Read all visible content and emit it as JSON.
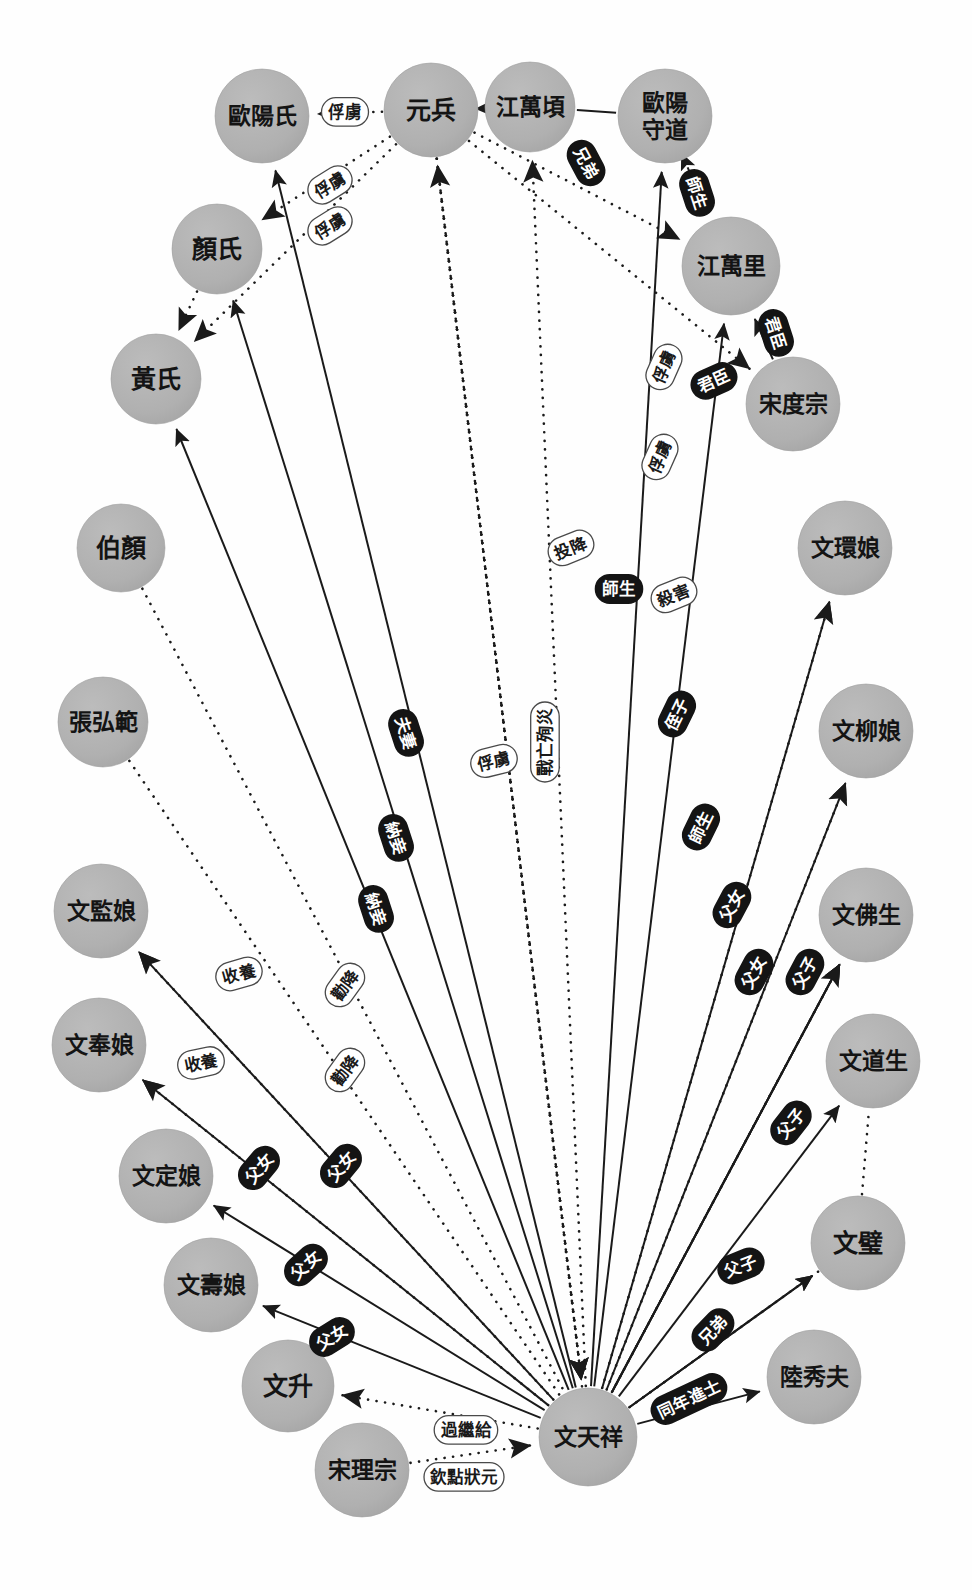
{
  "diagram": {
    "type": "social-network-graph",
    "canvas": {
      "width": 972,
      "height": 1590,
      "background": "#ffffff"
    },
    "style": {
      "node_fill": "#b1b1b1",
      "node_text": "#141414",
      "solid_edge_color": "#1a1a1a",
      "dotted_edge_color": "#1a1a1a",
      "dark_label_bg": "#141414",
      "dark_label_text": "#ffffff",
      "light_label_bg": "#ffffff",
      "light_label_text": "#1a1a1a",
      "light_label_border": "#4a4a4a"
    },
    "legend": {
      "solid_meaning": "實線：親屬／社會關係",
      "dotted_meaning": "虛線：敵對／事件關係"
    }
  },
  "nodes": [
    {
      "id": "ouyangshi",
      "label": "歐陽氏",
      "x": 262,
      "y": 116,
      "r": 47,
      "lines": [
        "歐陽氏"
      ]
    },
    {
      "id": "yuanbing",
      "label": "元兵",
      "x": 431,
      "y": 110,
      "r": 47,
      "lines": [
        "元兵"
      ]
    },
    {
      "id": "jiangwanqing",
      "label": "江萬頃",
      "x": 530,
      "y": 107,
      "r": 45,
      "lines": [
        "江萬頃"
      ]
    },
    {
      "id": "ouyangshoudao",
      "label": "歐陽守道",
      "x": 665,
      "y": 116,
      "r": 47,
      "lines": [
        "歐陽",
        "守道"
      ]
    },
    {
      "id": "yanshi",
      "label": "顏氏",
      "x": 217,
      "y": 249,
      "r": 45,
      "lines": [
        "顏氏"
      ]
    },
    {
      "id": "jiangwanli",
      "label": "江萬里",
      "x": 731,
      "y": 266,
      "r": 49,
      "lines": [
        "江萬里"
      ]
    },
    {
      "id": "huangshi",
      "label": "黃氏",
      "x": 156,
      "y": 379,
      "r": 45,
      "lines": [
        "黃氏"
      ]
    },
    {
      "id": "songduzong",
      "label": "宋度宗",
      "x": 793,
      "y": 404,
      "r": 47,
      "lines": [
        "宋度宗"
      ]
    },
    {
      "id": "wenhuanniang",
      "label": "文環娘",
      "x": 845,
      "y": 548,
      "r": 47,
      "lines": [
        "文環娘"
      ]
    },
    {
      "id": "boyan",
      "label": "伯顏",
      "x": 121,
      "y": 548,
      "r": 44,
      "lines": [
        "伯顏"
      ]
    },
    {
      "id": "wenliuniang",
      "label": "文柳娘",
      "x": 866,
      "y": 731,
      "r": 47,
      "lines": [
        "文柳娘"
      ]
    },
    {
      "id": "zhanghongfan",
      "label": "張弘範",
      "x": 103,
      "y": 722,
      "r": 45,
      "lines": [
        "張弘範"
      ]
    },
    {
      "id": "wenfosheng",
      "label": "文佛生",
      "x": 866,
      "y": 915,
      "r": 47,
      "lines": [
        "文佛生"
      ]
    },
    {
      "id": "wenjianniang",
      "label": "文監娘",
      "x": 101,
      "y": 911,
      "r": 47,
      "lines": [
        "文監娘"
      ]
    },
    {
      "id": "wendaosheng",
      "label": "文道生",
      "x": 873,
      "y": 1061,
      "r": 47,
      "lines": [
        "文道生"
      ]
    },
    {
      "id": "wenfengniang",
      "label": "文奉娘",
      "x": 99,
      "y": 1045,
      "r": 47,
      "lines": [
        "文奉娘"
      ]
    },
    {
      "id": "wendingniang",
      "label": "文定娘",
      "x": 166,
      "y": 1176,
      "r": 47,
      "lines": [
        "文定娘"
      ]
    },
    {
      "id": "wenbi",
      "label": "文璧",
      "x": 858,
      "y": 1243,
      "r": 47,
      "lines": [
        "文璧"
      ]
    },
    {
      "id": "wenshouniang",
      "label": "文壽娘",
      "x": 211,
      "y": 1285,
      "r": 47,
      "lines": [
        "文壽娘"
      ]
    },
    {
      "id": "luxiufu",
      "label": "陸秀夫",
      "x": 814,
      "y": 1377,
      "r": 47,
      "lines": [
        "陸秀夫"
      ]
    },
    {
      "id": "wensheng",
      "label": "文升",
      "x": 288,
      "y": 1386,
      "r": 46,
      "lines": [
        "文升"
      ]
    },
    {
      "id": "wentianxiang",
      "label": "文天祥",
      "x": 588,
      "y": 1437,
      "r": 49,
      "lines": [
        "文天祥"
      ]
    },
    {
      "id": "songlizong",
      "label": "宋理宗",
      "x": 362,
      "y": 1470,
      "r": 47,
      "lines": [
        "宋理宗"
      ]
    }
  ],
  "edges": [
    {
      "id": "e1",
      "from": "yuanbing",
      "to": "ouyangshi",
      "label": "俘虜",
      "style": "dotted",
      "label_style": "light",
      "label_x": 345,
      "label_y": 112,
      "rot": 0,
      "arrow": "to"
    },
    {
      "id": "e2",
      "from": "yuanbing",
      "to": "yanshi",
      "label": "俘虜",
      "style": "dotted",
      "label_style": "light",
      "label_x": 330,
      "label_y": 185,
      "rot": -32,
      "arrow": "to"
    },
    {
      "id": "e3",
      "from": "yuanbing",
      "to": "huangshi",
      "label": "俘虜",
      "style": "dotted",
      "label_style": "light",
      "label_x": 330,
      "label_y": 226,
      "rot": -32,
      "arrow": "to"
    },
    {
      "id": "e4",
      "from": "jiangwanqing",
      "to": "ouyangshoudao",
      "label": "兄弟",
      "style": "solid",
      "label_style": "dark",
      "label_x": 586,
      "label_y": 163,
      "rot": 62,
      "arrow": "none"
    },
    {
      "id": "e5",
      "from": "ouyangshoudao",
      "to": "jiangwanli",
      "label": "師生",
      "style": "solid",
      "label_style": "dark",
      "label_x": 697,
      "label_y": 193,
      "rot": 72,
      "arrow": "both"
    },
    {
      "id": "e6",
      "from": "songduzong",
      "to": "jiangwanli",
      "label": "君臣",
      "style": "solid",
      "label_style": "dark",
      "label_x": 776,
      "label_y": 333,
      "rot": 72,
      "arrow": "to"
    },
    {
      "id": "e7",
      "from": "wentianxiang",
      "to": "jiangwanli",
      "label": "君臣",
      "style": "solid",
      "label_style": "dark",
      "label_x": 714,
      "label_y": 381,
      "rot": -24,
      "arrow": "to"
    },
    {
      "id": "e8",
      "from": "yuanbing",
      "to": "jiangwanli",
      "label": "俘虜",
      "style": "dotted",
      "label_style": "light",
      "label_x": 664,
      "label_y": 367,
      "rot": -66,
      "arrow": "to"
    },
    {
      "id": "e9",
      "from": "yuanbing",
      "to": "songduzong",
      "label": "俘虜",
      "style": "dotted",
      "label_style": "light",
      "label_x": 660,
      "label_y": 457,
      "rot": -66,
      "arrow": "to"
    },
    {
      "id": "e10",
      "from": "yuanbing",
      "to": "wentianxiang",
      "label": "投降",
      "style": "dotted",
      "label_style": "light",
      "label_x": 571,
      "label_y": 548,
      "rot": -22,
      "arrow": "to"
    },
    {
      "id": "e11",
      "from": "wentianxiang",
      "to": "ouyangshoudao",
      "label": "師生",
      "style": "solid",
      "label_style": "dark",
      "label_x": 619,
      "label_y": 589,
      "rot": 0,
      "arrow": "to"
    },
    {
      "id": "e12",
      "from": "yuanbing",
      "to": "jiangwanqing",
      "label": "殺害",
      "style": "dotted",
      "label_style": "light",
      "label_x": 674,
      "label_y": 595,
      "rot": -22,
      "arrow": "to"
    },
    {
      "id": "e13",
      "from": "wentianxiang",
      "to": "yanshi",
      "label": "夫妻",
      "style": "solid",
      "label_style": "dark",
      "label_x": 406,
      "label_y": 733,
      "rot": 72,
      "arrow": "to"
    },
    {
      "id": "e14",
      "from": "wentianxiang",
      "to": "wenhuanniang",
      "label": "父女",
      "style": "solid",
      "label_style": "dark",
      "label_x": 732,
      "label_y": 905,
      "rot": -62,
      "arrow": "to"
    },
    {
      "id": "e15",
      "from": "wentianxiang",
      "to": "wenliuniang",
      "label": "侄子",
      "style": "dark-rot",
      "label_style": "dark",
      "label_x": 677,
      "label_y": 714,
      "rot": -64,
      "arrow": "to",
      "line": "solid"
    },
    {
      "id": "e16",
      "from": "wentianxiang",
      "to": "wenfosheng",
      "label": "師生",
      "style": "solid",
      "label_style": "dark",
      "label_x": 701,
      "label_y": 827,
      "rot": -64,
      "arrow": "to"
    },
    {
      "id": "e17",
      "from": "yuanbing",
      "to": "wentianxiang",
      "label": "俘虜",
      "style": "dotted",
      "label_style": "light",
      "label_x": 494,
      "label_y": 761,
      "rot": -14,
      "arrow": "to"
    },
    {
      "id": "e18",
      "from": "yuanbing",
      "to": "wentianxiang",
      "label": "戰亡殉災",
      "style": "dotted",
      "label_style": "light",
      "label_x": 545,
      "label_y": 742,
      "rot": -90,
      "arrow": "to"
    },
    {
      "id": "e19",
      "from": "wentianxiang",
      "to": "wenfosheng",
      "label": "父女",
      "style": "solid",
      "label_style": "dark",
      "label_x": 754,
      "label_y": 972,
      "rot": -62,
      "arrow": "to"
    },
    {
      "id": "e20",
      "from": "wentianxiang",
      "to": "wenfosheng",
      "label": "父子",
      "style": "solid",
      "label_style": "dark",
      "label_x": 805,
      "label_y": 972,
      "rot": -62,
      "arrow": "to"
    },
    {
      "id": "e21",
      "from": "wentianxiang",
      "to": "wendaosheng",
      "label": "父子",
      "style": "solid",
      "label_style": "dark",
      "label_x": 791,
      "label_y": 1123,
      "rot": -52,
      "arrow": "to"
    },
    {
      "id": "e22",
      "from": "wentianxiang",
      "to": "wenbi",
      "label": "父子",
      "style": "solid",
      "label_style": "dark",
      "label_x": 741,
      "label_y": 1266,
      "rot": -22,
      "arrow": "to"
    },
    {
      "id": "e23",
      "from": "wentianxiang",
      "to": "wenbi",
      "label": "兄弟",
      "style": "solid",
      "label_style": "dark",
      "label_x": 713,
      "label_y": 1330,
      "rot": -46,
      "arrow": "to"
    },
    {
      "id": "e24",
      "from": "wentianxiang",
      "to": "luxiufu",
      "label": "同年進士",
      "style": "solid",
      "label_style": "dark",
      "label_x": 689,
      "label_y": 1399,
      "rot": -25,
      "arrow": "to"
    },
    {
      "id": "e25",
      "from": "boyan",
      "to": "wentianxiang",
      "label": "勸降",
      "style": "dotted",
      "label_style": "light",
      "label_x": 345,
      "label_y": 985,
      "rot": -54,
      "arrow": "none"
    },
    {
      "id": "e26",
      "from": "zhanghongfan",
      "to": "wentianxiang",
      "label": "勸降",
      "style": "dotted",
      "label_style": "light",
      "label_x": 345,
      "label_y": 1070,
      "rot": -54,
      "arrow": "none"
    },
    {
      "id": "e27",
      "from": "wentianxiang",
      "to": "wenjianniang",
      "label": "收養",
      "style": "dotted",
      "label_style": "light",
      "label_x": 239,
      "label_y": 974,
      "rot": -16,
      "arrow": "to"
    },
    {
      "id": "e28",
      "from": "wentianxiang",
      "to": "wenfengniang",
      "label": "收養",
      "style": "dotted",
      "label_style": "light",
      "label_x": 201,
      "label_y": 1063,
      "rot": -12,
      "arrow": "to"
    },
    {
      "id": "e29",
      "from": "wentianxiang",
      "to": "wenjianniang",
      "label": "父女",
      "style": "solid",
      "label_style": "dark",
      "label_x": 341,
      "label_y": 1166,
      "rot": -50,
      "arrow": "to"
    },
    {
      "id": "e30",
      "from": "wentianxiang",
      "to": "wenfengniang",
      "label": "父女",
      "style": "solid",
      "label_style": "dark",
      "label_x": 259,
      "label_y": 1168,
      "rot": -50,
      "arrow": "to"
    },
    {
      "id": "e31",
      "from": "wentianxiang",
      "to": "wendingniang",
      "label": "父女",
      "style": "solid",
      "label_style": "dark",
      "label_x": 306,
      "label_y": 1265,
      "rot": -42,
      "arrow": "to"
    },
    {
      "id": "e32",
      "from": "wentianxiang",
      "to": "wenshouniang",
      "label": "父女",
      "style": "solid",
      "label_style": "dark",
      "label_x": 332,
      "label_y": 1337,
      "rot": -32,
      "arrow": "to"
    },
    {
      "id": "e33",
      "from": "wentianxiang",
      "to": "wensheng",
      "label": "過繼給",
      "style": "dotted",
      "label_style": "light",
      "label_x": 466,
      "label_y": 1430,
      "rot": 0,
      "arrow": "to"
    },
    {
      "id": "e34",
      "from": "songlizong",
      "to": "wentianxiang",
      "label": "欽點狀元",
      "style": "dotted",
      "label_style": "light",
      "label_x": 464,
      "label_y": 1477,
      "rot": 0,
      "arrow": "to"
    },
    {
      "id": "e35",
      "from": "wentianxiang",
      "to": "yuanbing",
      "label": "",
      "style": "dotted",
      "label_style": "none",
      "label_x": 0,
      "label_y": 0,
      "rot": 0,
      "arrow": "to"
    },
    {
      "id": "e36",
      "from": "wentianxiang",
      "to": "jiangwanqing",
      "label": "",
      "style": "dotted",
      "label_style": "none",
      "label_x": 0,
      "label_y": 0,
      "rot": 0,
      "arrow": "to"
    },
    {
      "id": "e37",
      "from": "wentianxiang",
      "to": "huangshi",
      "label": "納妾",
      "style": "solid",
      "label_style": "dark",
      "label_x": 396,
      "label_y": 838,
      "rot": 72,
      "arrow": "to"
    },
    {
      "id": "e38",
      "from": "wentianxiang",
      "to": "ouyangshi",
      "label": "納妾",
      "style": "solid",
      "label_style": "dark",
      "label_x": 376,
      "label_y": 909,
      "rot": 72,
      "arrow": "to"
    },
    {
      "id": "e39",
      "from": "yanshi",
      "to": "huangshi",
      "label": "",
      "style": "dotted",
      "label_style": "none",
      "label_x": 0,
      "label_y": 0,
      "rot": 0,
      "arrow": "to"
    },
    {
      "id": "e40",
      "from": "wenbi",
      "to": "wendaosheng",
      "label": "",
      "style": "dotted",
      "label_style": "none",
      "label_x": 0,
      "label_y": 0,
      "rot": 0,
      "arrow": "none"
    },
    {
      "id": "e41",
      "from": "wentianxiang",
      "to": "wenliuniang",
      "label": "",
      "style": "dotted",
      "label_style": "none",
      "label_x": 0,
      "label_y": 0,
      "rot": 0,
      "arrow": "to"
    },
    {
      "id": "e42",
      "from": "wentianxiang",
      "to": "wenfosheng",
      "label": "",
      "style": "dotted",
      "label_style": "none",
      "label_x": 0,
      "label_y": 0,
      "rot": 0,
      "arrow": "to"
    },
    {
      "id": "e43",
      "from": "wentianxiang",
      "to": "wenhuanniang",
      "label": "",
      "style": "dotted",
      "label_style": "none",
      "label_x": 0,
      "label_y": 0,
      "rot": 0,
      "arrow": "to"
    },
    {
      "id": "e44",
      "from": "wentianxiang",
      "to": "wenbi",
      "label": "",
      "style": "dotted",
      "label_style": "none",
      "label_x": 0,
      "label_y": 0,
      "rot": 0,
      "arrow": "none"
    }
  ]
}
